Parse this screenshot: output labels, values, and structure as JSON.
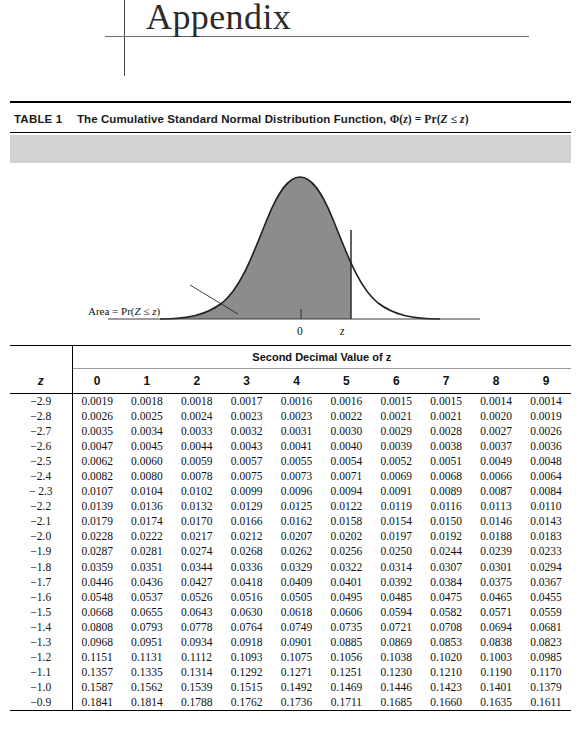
{
  "page": {
    "heading": "Appendix"
  },
  "table": {
    "label": "TABLE 1",
    "caption_prefix": "The Cumulative Standard Normal Distribution Function,",
    "caption_formula": "Φ(z) = Pr(Z ≤ z)",
    "caption_full": "The Cumulative Standard Normal Distribution Function, Φ(z) = Pr(Z ≤ z)",
    "group_header": "Second Decimal Value of z",
    "row_header": "z",
    "column_headers": [
      "0",
      "1",
      "2",
      "3",
      "4",
      "5",
      "6",
      "7",
      "8",
      "9"
    ]
  },
  "figure": {
    "area_annotation": "Area = Pr(Z ≤ z)",
    "axis_tick_zero": "0",
    "axis_tick_z": "z",
    "band_color": "#d2d2d2",
    "curve_fill_color": "#8c8c8c",
    "curve_line_color": "#1f1f1f"
  },
  "chart_data": {
    "type": "area",
    "title": "Cumulative Standard Normal Distribution Function",
    "xlabel": "",
    "ylabel": "",
    "x_ticks": [
      "0",
      "z"
    ],
    "shaded_region": "Area = Pr(Z ≤ z)",
    "shade_upper_bound_z": 1.0,
    "distribution": "standard normal",
    "mean": 0,
    "sd": 1,
    "grid": false,
    "legend": "none"
  },
  "rows": [
    {
      "x": "−2.9",
      "v": [
        "0.0019",
        "0.0018",
        "0.0018",
        "0.0017",
        "0.0016",
        "0.0016",
        "0.0015",
        "0.0015",
        "0.0014",
        "0.0014"
      ]
    },
    {
      "x": "−2.8",
      "v": [
        "0.0026",
        "0.0025",
        "0.0024",
        "0.0023",
        "0.0023",
        "0.0022",
        "0.0021",
        "0.0021",
        "0.0020",
        "0.0019"
      ]
    },
    {
      "x": "−2.7",
      "v": [
        "0.0035",
        "0.0034",
        "0.0033",
        "0.0032",
        "0.0031",
        "0.0030",
        "0.0029",
        "0.0028",
        "0.0027",
        "0.0026"
      ]
    },
    {
      "x": "−2.6",
      "v": [
        "0.0047",
        "0.0045",
        "0.0044",
        "0.0043",
        "0.0041",
        "0.0040",
        "0.0039",
        "0.0038",
        "0.0037",
        "0.0036"
      ]
    },
    {
      "x": "−2.5",
      "v": [
        "0.0062",
        "0.0060",
        "0.0059",
        "0.0057",
        "0.0055",
        "0.0054",
        "0.0052",
        "0.0051",
        "0.0049",
        "0.0048"
      ]
    },
    {
      "x": "−2.4",
      "v": [
        "0.0082",
        "0.0080",
        "0.0078",
        "0.0075",
        "0.0073",
        "0.0071",
        "0.0069",
        "0.0068",
        "0.0066",
        "0.0064"
      ]
    },
    {
      "x": "− 2.3",
      "v": [
        "0.0107",
        "0.0104",
        "0.0102",
        "0.0099",
        "0.0096",
        "0.0094",
        "0.0091",
        "0.0089",
        "0.0087",
        "0.0084"
      ]
    },
    {
      "x": "−2.2",
      "v": [
        "0.0139",
        "0.0136",
        "0.0132",
        "0.0129",
        "0.0125",
        "0.0122",
        "0.0119",
        "0.0116",
        "0.0113",
        "0.0110"
      ]
    },
    {
      "x": "−2.1",
      "v": [
        "0.0179",
        "0.0174",
        "0.0170",
        "0.0166",
        "0.0162",
        "0.0158",
        "0.0154",
        "0.0150",
        "0.0146",
        "0.0143"
      ]
    },
    {
      "x": "−2.0",
      "v": [
        "0.0228",
        "0.0222",
        "0.0217",
        "0.0212",
        "0.0207",
        "0.0202",
        "0.0197",
        "0.0192",
        "0.0188",
        "0.0183"
      ]
    },
    {
      "x": "−1.9",
      "v": [
        "0.0287",
        "0.0281",
        "0.0274",
        "0.0268",
        "0.0262",
        "0.0256",
        "0.0250",
        "0.0244",
        "0.0239",
        "0.0233"
      ]
    },
    {
      "x": "−1.8",
      "v": [
        "0.0359",
        "0.0351",
        "0.0344",
        "0.0336",
        "0.0329",
        "0.0322",
        "0.0314",
        "0.0307",
        "0.0301",
        "0.0294"
      ]
    },
    {
      "x": "−1.7",
      "v": [
        "0.0446",
        "0.0436",
        "0.0427",
        "0.0418",
        "0.0409",
        "0.0401",
        "0.0392",
        "0.0384",
        "0.0375",
        "0.0367"
      ]
    },
    {
      "x": "−1.6",
      "v": [
        "0.0548",
        "0.0537",
        "0.0526",
        "0.0516",
        "0.0505",
        "0.0495",
        "0.0485",
        "0.0475",
        "0.0465",
        "0.0455"
      ]
    },
    {
      "x": "−1.5",
      "v": [
        "0.0668",
        "0.0655",
        "0.0643",
        "0.0630",
        "0.0618",
        "0.0606",
        "0.0594",
        "0.0582",
        "0.0571",
        "0.0559"
      ]
    },
    {
      "x": "−1.4",
      "v": [
        "0.0808",
        "0.0793",
        "0.0778",
        "0.0764",
        "0.0749",
        "0.0735",
        "0.0721",
        "0.0708",
        "0.0694",
        "0.0681"
      ]
    },
    {
      "x": "−1.3",
      "v": [
        "0.0968",
        "0.0951",
        "0.0934",
        "0.0918",
        "0.0901",
        "0.0885",
        "0.0869",
        "0.0853",
        "0.0838",
        "0.0823"
      ]
    },
    {
      "x": "−1.2",
      "v": [
        "0.1151",
        "0.1131",
        "0.1112",
        "0.1093",
        "0.1075",
        "0.1056",
        "0.1038",
        "0.1020",
        "0.1003",
        "0.0985"
      ]
    },
    {
      "x": "−1.1",
      "v": [
        "0.1357",
        "0.1335",
        "0.1314",
        "0.1292",
        "0.1271",
        "0.1251",
        "0.1230",
        "0.1210",
        "0.1190",
        "0.1170"
      ]
    },
    {
      "x": "−1.0",
      "v": [
        "0.1587",
        "0.1562",
        "0.1539",
        "0.1515",
        "0.1492",
        "0.1469",
        "0.1446",
        "0.1423",
        "0.1401",
        "0.1379"
      ]
    },
    {
      "x": "−0.9",
      "v": [
        "0.1841",
        "0.1814",
        "0.1788",
        "0.1762",
        "0.1736",
        "0.1711",
        "0.1685",
        "0.1660",
        "0.1635",
        "0.1611"
      ]
    }
  ]
}
